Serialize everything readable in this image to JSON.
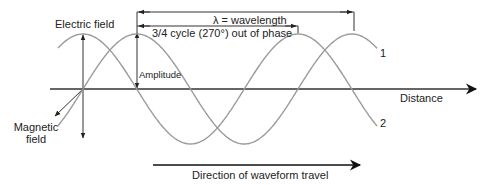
{
  "labels": {
    "electric_field": "Electric field",
    "magnetic_field_line1": "Magnetic",
    "magnetic_field_line2": "field",
    "wavelength": "λ = wavelength",
    "phase": "3/4 cycle (270°) out of phase",
    "amplitude": "Amplitude",
    "distance": "Distance",
    "direction": "Direction of waveform travel",
    "wave1": "1",
    "wave2": "2"
  },
  "colors": {
    "wave": "#9a9a9a",
    "axis": "#333333",
    "text": "#222222"
  },
  "geometry": {
    "axis_y": 89,
    "origin_x": 83,
    "wavelength_px": 215,
    "amplitude_px": 55
  }
}
